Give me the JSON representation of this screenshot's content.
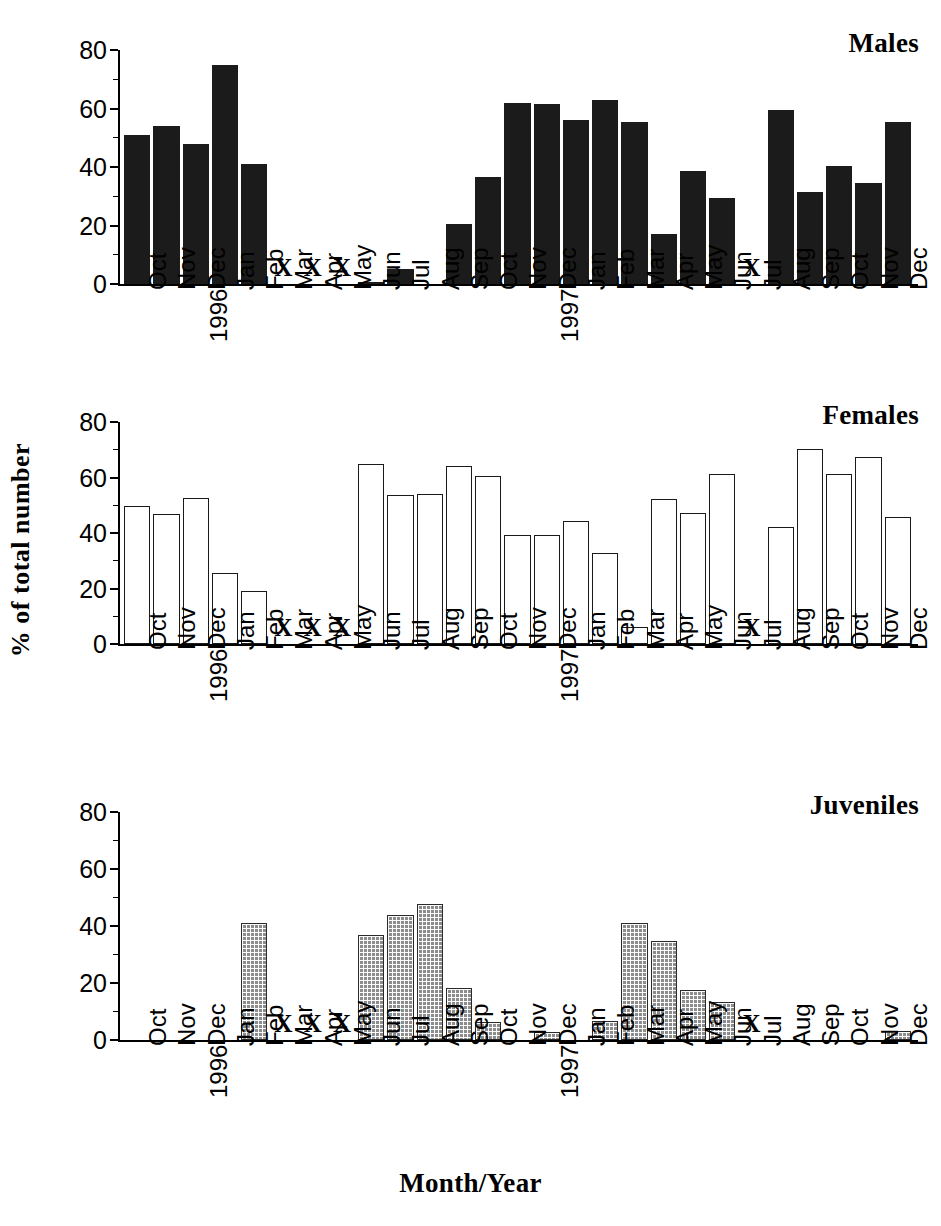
{
  "figure": {
    "xlabel": "Month/Year",
    "ylabel": "% of total number",
    "missing_marker": "X"
  },
  "chart_data": [
    {
      "type": "bar",
      "title": "Males",
      "xlabel": "Month/Year",
      "ylabel": "% of total number",
      "ylim": [
        0,
        80
      ],
      "yticks": [
        0,
        20,
        40,
        60,
        80
      ],
      "grid": false,
      "legend": "none",
      "bar_style": "solid-black",
      "categories": [
        "Oct",
        "Nov",
        "Dec",
        "Jan",
        "Feb",
        "Mar",
        "Apr",
        "May",
        "Jun",
        "Jul",
        "Aug",
        "Sep",
        "Oct",
        "Nov",
        "Dec",
        "Jan",
        "Feb",
        "Mar",
        "Apr",
        "May",
        "Jun",
        "Jul",
        "Aug",
        "Sep",
        "Oct",
        "Nov",
        "Dec"
      ],
      "year_labels": {
        "3": "1996",
        "15": "1997"
      },
      "values": [
        51,
        54,
        48,
        75,
        41,
        null,
        null,
        null,
        0.6,
        5,
        0,
        20.5,
        36.5,
        62,
        61.5,
        56,
        63,
        55.5,
        17,
        38.5,
        29.5,
        null,
        59.5,
        31.5,
        40.5,
        34.5,
        55.5
      ],
      "missing": [
        "Mar",
        "Apr",
        "May",
        "Jul"
      ]
    },
    {
      "type": "bar",
      "title": "Females",
      "xlabel": "Month/Year",
      "ylabel": "% of total number",
      "ylim": [
        0,
        80
      ],
      "yticks": [
        0,
        20,
        40,
        60,
        80
      ],
      "grid": false,
      "legend": "none",
      "bar_style": "hollow-white",
      "categories": [
        "Oct",
        "Nov",
        "Dec",
        "Jan",
        "Feb",
        "Mar",
        "Apr",
        "May",
        "Jun",
        "Jul",
        "Aug",
        "Sep",
        "Oct",
        "Nov",
        "Dec",
        "Jan",
        "Feb",
        "Mar",
        "Apr",
        "May",
        "Jun",
        "Jul",
        "Aug",
        "Sep",
        "Oct",
        "Nov",
        "Dec"
      ],
      "year_labels": {
        "3": "1996",
        "15": "1997"
      },
      "values": [
        49,
        46,
        52,
        25,
        18.5,
        null,
        null,
        null,
        64,
        53,
        53.5,
        63.5,
        60,
        38.5,
        38.5,
        43.5,
        32,
        5.5,
        51.5,
        46.5,
        60.5,
        null,
        41.5,
        69.5,
        60.5,
        66.5,
        45
      ],
      "missing": [
        "Mar",
        "Apr",
        "May",
        "Jul"
      ]
    },
    {
      "type": "bar",
      "title": "Juveniles",
      "xlabel": "Month/Year",
      "ylabel": "% of total number",
      "ylim": [
        0,
        80
      ],
      "yticks": [
        0,
        20,
        40,
        60,
        80
      ],
      "grid": false,
      "legend": "none",
      "bar_style": "grey-crosshatch",
      "categories": [
        "Oct",
        "Nov",
        "Dec",
        "Jan",
        "Feb",
        "Mar",
        "Apr",
        "May",
        "Jun",
        "Jul",
        "Aug",
        "Sep",
        "Oct",
        "Nov",
        "Dec",
        "Jan",
        "Feb",
        "Mar",
        "Apr",
        "May",
        "Jun",
        "Jul",
        "Aug",
        "Sep",
        "Oct",
        "Nov",
        "Dec"
      ],
      "year_labels": {
        "3": "1996",
        "15": "1997"
      },
      "values": [
        0,
        0,
        0,
        0,
        40.5,
        null,
        null,
        null,
        36,
        43,
        47,
        17.5,
        5.5,
        0,
        2,
        0,
        6,
        40.5,
        34,
        17,
        12.5,
        null,
        0,
        0,
        0,
        0,
        2.5
      ],
      "missing": [
        "Mar",
        "Apr",
        "May",
        "Jul"
      ]
    }
  ],
  "panels": [
    {
      "name": "males-panel",
      "title": "Males",
      "top": 28,
      "plot_top": 22,
      "plot_height": 234
    },
    {
      "name": "females-panel",
      "title": "Females",
      "top": 400,
      "plot_top": 22,
      "plot_height": 222
    },
    {
      "name": "juveniles-panel",
      "title": "Juveniles",
      "top": 790,
      "plot_top": 22,
      "plot_height": 228
    }
  ]
}
